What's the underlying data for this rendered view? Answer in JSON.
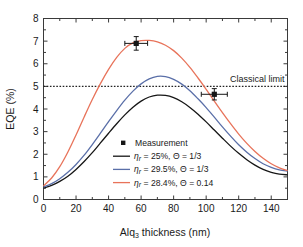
{
  "chart_data": {
    "type": "line",
    "title": "",
    "xlabel": "Alq3 thickness (nm)",
    "xlabel_main": "Alq",
    "xlabel_sub": "3",
    "xlabel_rest": " thickness (nm)",
    "ylabel": "EQE (%)",
    "xlim": [
      0,
      150
    ],
    "ylim": [
      0,
      8
    ],
    "xticks": [
      0,
      20,
      40,
      60,
      80,
      100,
      120,
      140
    ],
    "yticks": [
      0,
      1,
      2,
      3,
      4,
      5,
      6,
      7,
      8
    ],
    "xtick_labels": [
      "0",
      "20",
      "40",
      "60",
      "80",
      "100",
      "120",
      "140"
    ],
    "ytick_labels": [
      "0",
      "1",
      "2",
      "3",
      "4",
      "5",
      "6",
      "7",
      "8"
    ],
    "grid": false,
    "legend_position": "inside-bottom-center",
    "x": [
      0,
      5,
      10,
      15,
      20,
      25,
      30,
      35,
      40,
      45,
      50,
      55,
      60,
      65,
      70,
      75,
      80,
      85,
      90,
      95,
      100,
      105,
      110,
      115,
      120,
      125,
      130,
      135,
      140,
      145,
      150
    ],
    "series": [
      {
        "name": "eta_r = 25%, Theta = 1/3",
        "color": "#161616",
        "label_parts": {
          "eta": "η",
          "sub": "r",
          "mid": " = 25%, ",
          "theta": "Θ",
          "end": " = 1/3"
        },
        "values": [
          0.5,
          0.62,
          0.8,
          1.03,
          1.33,
          1.68,
          2.07,
          2.5,
          2.93,
          3.35,
          3.74,
          4.08,
          4.35,
          4.53,
          4.61,
          4.6,
          4.5,
          4.32,
          4.07,
          3.77,
          3.43,
          3.07,
          2.71,
          2.36,
          2.04,
          1.76,
          1.52,
          1.33,
          1.2,
          1.12,
          1.09
        ]
      },
      {
        "name": "eta_r = 29.5%, Theta = 1/3",
        "color": "#5a6fa8",
        "label_parts": {
          "eta": "η",
          "sub": "r",
          "mid": " = 29.5%, ",
          "theta": "Θ",
          "end": " = 1/3"
        },
        "values": [
          0.55,
          0.7,
          0.92,
          1.2,
          1.55,
          1.96,
          2.43,
          2.93,
          3.44,
          3.93,
          4.39,
          4.79,
          5.11,
          5.33,
          5.44,
          5.43,
          5.31,
          5.1,
          4.81,
          4.45,
          4.06,
          3.64,
          3.21,
          2.8,
          2.42,
          2.09,
          1.81,
          1.58,
          1.42,
          1.31,
          1.26
        ]
      },
      {
        "name": "eta_r = 28.4%, Theta = 0.14",
        "color": "#e8735a",
        "label_parts": {
          "eta": "η",
          "sub": "r",
          "mid": " = 28.4%, ",
          "theta": "Θ",
          "end": " = 0.14"
        },
        "values": [
          0.6,
          0.95,
          1.45,
          2.1,
          2.85,
          3.65,
          4.42,
          5.12,
          5.75,
          6.28,
          6.68,
          6.92,
          7.02,
          7.03,
          6.97,
          6.82,
          6.58,
          6.25,
          5.84,
          5.37,
          4.87,
          4.35,
          3.84,
          3.35,
          2.89,
          2.48,
          2.12,
          1.82,
          1.58,
          1.4,
          1.28
        ]
      }
    ],
    "measurements": {
      "name": "Measurement",
      "color": "#161616",
      "points": [
        {
          "x": 57,
          "y": 6.9,
          "xerr": 7,
          "yerr": 0.3
        },
        {
          "x": 105,
          "y": 4.65,
          "xerr": 8,
          "yerr": 0.25
        }
      ]
    },
    "annotations": [
      {
        "name": "classical-limit",
        "text": "Classical limit",
        "y": 5.0,
        "style": "dotted-horizontal-line",
        "label_x": 108,
        "label_y": 5.35
      }
    ],
    "legend_entries": [
      {
        "marker": "square",
        "label": "Measurement",
        "color": "#161616"
      },
      {
        "marker": "line",
        "label": "ηr = 25%, Θ = 1/3",
        "color": "#161616"
      },
      {
        "marker": "line",
        "label": "ηr = 29.5%, Θ = 1/3",
        "color": "#5a6fa8"
      },
      {
        "marker": "line",
        "label": "ηr = 28.4%, Θ = 0.14",
        "color": "#e8735a"
      }
    ]
  }
}
